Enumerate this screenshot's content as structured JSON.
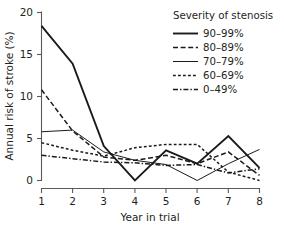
{
  "chart_data": {
    "type": "line",
    "title": "",
    "xlabel": "Year in trial",
    "ylabel": "Annual risk of stroke (%)",
    "legend_title": "Severity of stenosis",
    "legend_position": "top-right",
    "grid": false,
    "x": [
      1,
      2,
      3,
      4,
      5,
      6,
      7,
      8
    ],
    "xtick_labels": [
      "1",
      "2",
      "3",
      "4",
      "5",
      "6",
      "7",
      "8"
    ],
    "ytick_labels": [
      "0",
      "5",
      "10",
      "15",
      "20"
    ],
    "ytick_values": [
      0,
      5,
      10,
      15,
      20
    ],
    "xlim": [
      1,
      8
    ],
    "ylim": [
      0,
      20
    ],
    "series": [
      {
        "name": "90–99%",
        "style": "solid-thick",
        "values": [
          18.4,
          13.9,
          4.1,
          0.0,
          3.6,
          2.0,
          5.3,
          1.5
        ]
      },
      {
        "name": "80–89%",
        "style": "dashed-long",
        "values": [
          10.8,
          5.9,
          2.8,
          2.4,
          3.0,
          2.0,
          3.4,
          0.6
        ]
      },
      {
        "name": "70–79%",
        "style": "solid-thin",
        "values": [
          5.8,
          6.0,
          3.4,
          2.4,
          1.9,
          0.0,
          2.0,
          3.7
        ]
      },
      {
        "name": "60–69%",
        "style": "dashed-short",
        "values": [
          4.5,
          3.6,
          2.9,
          3.9,
          4.3,
          4.3,
          1.0,
          0.0
        ]
      },
      {
        "name": "0–49%",
        "style": "dash-dot",
        "values": [
          3.0,
          2.6,
          2.2,
          2.1,
          1.8,
          1.9,
          0.9,
          1.4
        ]
      }
    ]
  },
  "axes": {
    "y_title": "Annual risk of stroke (%)",
    "x_title": "Year in trial"
  },
  "legend": {
    "title": "Severity of stenosis",
    "items": [
      {
        "label": "90–99%"
      },
      {
        "label": "80–89%"
      },
      {
        "label": "70–79%"
      },
      {
        "label": "60–69%"
      },
      {
        "label": "0–49%"
      }
    ]
  },
  "colors": {
    "ink": "#1a1a1a",
    "axis": "#58595b",
    "background": "#ffffff"
  }
}
